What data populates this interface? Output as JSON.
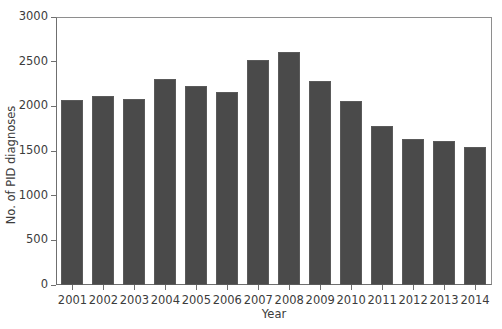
{
  "chart_data": {
    "type": "bar",
    "title": "",
    "xlabel": "Year",
    "ylabel": "No. of PID diagnoses",
    "categories": [
      "2001",
      "2002",
      "2003",
      "2004",
      "2005",
      "2006",
      "2007",
      "2008",
      "2009",
      "2010",
      "2011",
      "2012",
      "2013",
      "2014"
    ],
    "values": [
      2070,
      2120,
      2080,
      2310,
      2230,
      2160,
      2520,
      2610,
      2280,
      2060,
      1780,
      1630,
      1610,
      1550
    ],
    "series": [
      {
        "name": "No. of PID diagnoses",
        "values": [
          2070,
          2120,
          2080,
          2310,
          2230,
          2160,
          2520,
          2610,
          2280,
          2060,
          1780,
          1630,
          1610,
          1550
        ]
      }
    ],
    "ylim": [
      0,
      3000
    ],
    "ytick_labels": [
      "0",
      "500",
      "1000",
      "1500",
      "2000",
      "2500",
      "3000"
    ],
    "ytick_values": [
      0,
      500,
      1000,
      1500,
      2000,
      2500,
      3000
    ],
    "grid": false,
    "legend": false,
    "legend_position": "none",
    "bar_color": "#4a4a4a",
    "background_color": "#ffffff",
    "axis_color": "#6f6f6f"
  }
}
